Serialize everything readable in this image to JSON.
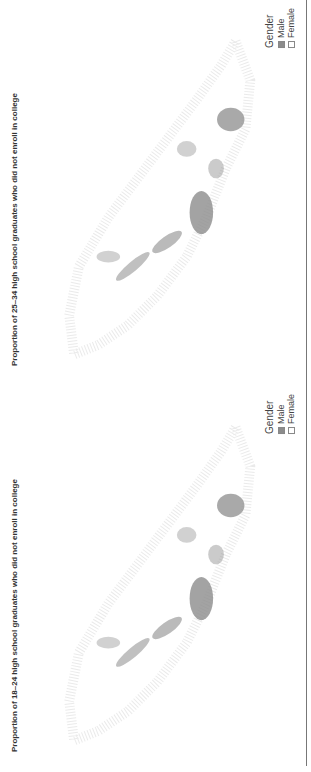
{
  "panels": [
    {
      "id": "age-25-34",
      "title": "Proportion of 25–34 high school graduates who did not enroll in college",
      "legend": {
        "title": "Gender",
        "items": [
          {
            "label": "Male",
            "color": "#8c8c8c"
          },
          {
            "label": "Female",
            "color": "#ffffff"
          }
        ]
      }
    },
    {
      "id": "age-18-24",
      "title": "Proportion of 18–24 high school graduates who did not enroll in college",
      "legend": {
        "title": "Gender",
        "items": [
          {
            "label": "Male",
            "color": "#8c8c8c"
          },
          {
            "label": "Female",
            "color": "#ffffff"
          }
        ]
      }
    }
  ],
  "map": {
    "type": "dot-density",
    "dot_color": "#8c8c8c",
    "background": "#ffffff"
  }
}
